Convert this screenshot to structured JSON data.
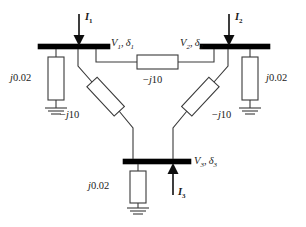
{
  "diagram": {
    "type": "power-system-one-line",
    "buses": [
      {
        "id": "bus1",
        "label_v": "V",
        "label_sub": "1",
        "label_delta": "δ",
        "label_text": "V₁, δ₁"
      },
      {
        "id": "bus2",
        "label_v": "V",
        "label_sub": "2",
        "label_delta": "δ",
        "label_text": "V₂, δ₂"
      },
      {
        "id": "bus3",
        "label_v": "V",
        "label_sub": "3",
        "label_delta": "δ",
        "label_text": "V₃, δ₃"
      }
    ],
    "currents": [
      {
        "id": "I1",
        "label": "I",
        "sub": "1",
        "direction": "into-bus-down"
      },
      {
        "id": "I2",
        "label": "I",
        "sub": "2",
        "direction": "into-bus-down"
      },
      {
        "id": "I3",
        "label": "I",
        "sub": "3",
        "direction": "into-bus-up"
      }
    ],
    "shunt_impedance_label": "j0.02",
    "shunt_impedance_j": "j",
    "shunt_impedance_value": "0.02",
    "series_impedance_label": "−j10",
    "series_impedance_sign": "−",
    "series_impedance_j": "j",
    "series_impedance_value": "10",
    "shunts": [
      {
        "id": "shunt1",
        "bus": "bus1",
        "value": "j0.02"
      },
      {
        "id": "shunt2",
        "bus": "bus2",
        "value": "j0.02"
      },
      {
        "id": "shunt3",
        "bus": "bus3",
        "value": "j0.02"
      }
    ],
    "branches": [
      {
        "id": "branch-1-2",
        "from": "bus1",
        "to": "bus2",
        "value": "−j10"
      },
      {
        "id": "branch-1-3",
        "from": "bus1",
        "to": "bus3",
        "value": "−j10"
      },
      {
        "id": "branch-2-3",
        "from": "bus2",
        "to": "bus3",
        "value": "−j10"
      }
    ],
    "colors": {
      "line": "#3a3a3a",
      "bus": "#000000",
      "background": "#ffffff",
      "text": "#1a1a1a"
    }
  }
}
